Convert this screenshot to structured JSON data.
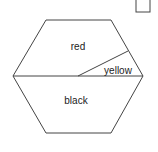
{
  "diagram": {
    "regions": [
      {
        "id": "red",
        "label": "red"
      },
      {
        "id": "yellow",
        "label": "yellow"
      },
      {
        "id": "black",
        "label": "black"
      }
    ]
  }
}
